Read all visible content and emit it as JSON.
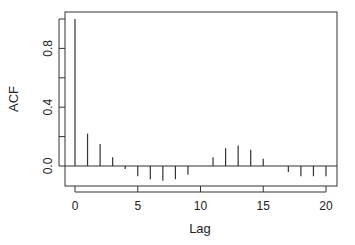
{
  "chart_data": {
    "type": "bar",
    "subtype": "acf-stem",
    "title": "",
    "xlabel": "Lag",
    "ylabel": "ACF",
    "x": [
      0,
      1,
      2,
      3,
      4,
      5,
      6,
      7,
      8,
      9,
      10,
      11,
      12,
      13,
      14,
      15,
      16,
      17,
      18,
      19,
      20
    ],
    "values": [
      1.0,
      0.22,
      0.15,
      0.06,
      -0.02,
      -0.07,
      -0.09,
      -0.1,
      -0.09,
      -0.06,
      0.0,
      0.06,
      0.12,
      0.14,
      0.11,
      0.05,
      0.0,
      -0.04,
      -0.07,
      -0.07,
      -0.07
    ],
    "xticks": [
      0,
      5,
      10,
      15,
      20
    ],
    "xtick_labels": [
      "0",
      "5",
      "10",
      "15",
      "20"
    ],
    "yticks": [
      0.0,
      0.2,
      0.4,
      0.6,
      0.8,
      1.0
    ],
    "ytick_labels": [
      "0.0",
      "",
      "0.4",
      "",
      "0.8",
      ""
    ],
    "xlim": [
      -0.8,
      20.8
    ],
    "ylim": [
      -0.14,
      1.04
    ],
    "zero_line": true,
    "grid": false,
    "legend": null
  }
}
